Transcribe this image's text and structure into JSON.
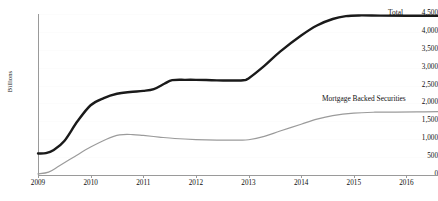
{
  "chart_data": {
    "type": "line",
    "title": "",
    "xlabel": "",
    "ylabel": "Billions",
    "ylim": [
      0,
      4500
    ],
    "xlim": [
      2009,
      2016.6
    ],
    "grid": true,
    "legend_position": "inline-right",
    "y_ticks": [
      "0",
      "500",
      "1,000",
      "1,500",
      "2,000",
      "2,500",
      "3,000",
      "3,500",
      "4,000",
      "4,500"
    ],
    "y_tick_values": [
      0,
      500,
      1000,
      1500,
      2000,
      2500,
      3000,
      3500,
      4000,
      4500
    ],
    "x_ticks": [
      "2009",
      "2010",
      "2011",
      "2012",
      "2013",
      "2014",
      "2015",
      "2016"
    ],
    "x_tick_values": [
      2009,
      2010,
      2011,
      2012,
      2013,
      2014,
      2015,
      2016
    ],
    "series": [
      {
        "name": "Total",
        "color": "#1a1a1a",
        "width": 2.4,
        "x": [
          2009.0,
          2009.15,
          2009.3,
          2009.5,
          2009.75,
          2010.0,
          2010.25,
          2010.5,
          2010.75,
          2011.0,
          2011.2,
          2011.4,
          2011.55,
          2011.8,
          2012.0,
          2012.3,
          2012.6,
          2012.9,
          2013.0,
          2013.3,
          2013.6,
          2014.0,
          2014.3,
          2014.6,
          2014.85,
          2015.1,
          2015.5,
          2016.0,
          2016.6
        ],
        "y": [
          600,
          610,
          700,
          950,
          1500,
          1950,
          2150,
          2270,
          2320,
          2350,
          2400,
          2550,
          2650,
          2660,
          2660,
          2650,
          2640,
          2650,
          2700,
          3050,
          3450,
          3900,
          4180,
          4360,
          4440,
          4460,
          4455,
          4450,
          4450
        ]
      },
      {
        "name": "Mortgage Backed Securities",
        "color": "#9b9b9b",
        "width": 1.2,
        "x": [
          2009.0,
          2009.2,
          2009.4,
          2009.7,
          2010.0,
          2010.3,
          2010.55,
          2010.8,
          2011.0,
          2011.3,
          2011.6,
          2012.0,
          2012.4,
          2012.8,
          2013.0,
          2013.3,
          2013.6,
          2014.0,
          2014.3,
          2014.6,
          2015.0,
          2015.4,
          2015.8,
          2016.2,
          2016.6
        ],
        "y": [
          30,
          80,
          250,
          520,
          780,
          1000,
          1120,
          1130,
          1105,
          1060,
          1020,
          990,
          975,
          975,
          985,
          1080,
          1230,
          1420,
          1560,
          1660,
          1730,
          1755,
          1760,
          1765,
          1770
        ]
      }
    ]
  },
  "labels": {
    "y_axis_title": "Billions",
    "total": "Total",
    "mbs": "Mortgage Backed Securities"
  }
}
